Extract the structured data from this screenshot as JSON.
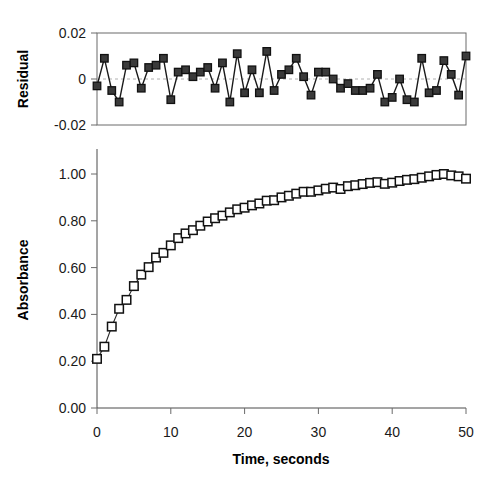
{
  "chart_data": [
    {
      "type": "scatter",
      "name": "residual-plot",
      "title": "",
      "xlabel": "",
      "ylabel": "Residual",
      "xlim": [
        0,
        50
      ],
      "ylim": [
        -0.02,
        0.02
      ],
      "grid": false,
      "legend": "none",
      "marker": "filled-square",
      "yticklabels": [
        "0.02",
        "0",
        "-0.02"
      ],
      "ytickvalues": [
        0.02,
        0,
        -0.02
      ],
      "xticklabels": [],
      "x": [
        0,
        1,
        2,
        3,
        4,
        5,
        6,
        7,
        8,
        9,
        10,
        11,
        12,
        13,
        14,
        15,
        16,
        17,
        18,
        19,
        20,
        21,
        22,
        23,
        24,
        25,
        26,
        27,
        28,
        29,
        30,
        31,
        32,
        33,
        34,
        35,
        36,
        37,
        38,
        39,
        40,
        41,
        42,
        43,
        44,
        45,
        46,
        47,
        48,
        49,
        50
      ],
      "values": [
        -0.003,
        0.009,
        -0.005,
        -0.01,
        0.006,
        0.007,
        -0.004,
        0.005,
        0.006,
        0.009,
        -0.009,
        0.003,
        0.004,
        0.001,
        0.003,
        0.005,
        -0.004,
        0.007,
        -0.01,
        0.011,
        -0.006,
        0.004,
        -0.006,
        0.012,
        -0.005,
        0.002,
        0.004,
        0.009,
        0.001,
        -0.007,
        0.003,
        0.003,
        0.0,
        -0.004,
        -0.002,
        -0.005,
        -0.005,
        -0.004,
        0.002,
        -0.01,
        -0.008,
        0.0,
        -0.009,
        -0.01,
        0.009,
        -0.006,
        -0.005,
        0.008,
        0.002,
        -0.007,
        0.01
      ]
    },
    {
      "type": "scatter",
      "name": "absorbance-kinetics",
      "title": "",
      "xlabel": "Time, seconds",
      "ylabel": "Absorbance",
      "xlim": [
        0,
        50
      ],
      "ylim": [
        0.0,
        1.1
      ],
      "grid": false,
      "legend": "none",
      "marker": "open-square",
      "xticklabels": [
        "0",
        "10",
        "20",
        "30",
        "40",
        "50"
      ],
      "xtickvalues": [
        0,
        10,
        20,
        30,
        40,
        50
      ],
      "yticklabels": [
        "0.00",
        "0.20",
        "0.40",
        "0.60",
        "0.80",
        "1.00"
      ],
      "ytickvalues": [
        0.0,
        0.2,
        0.4,
        0.6,
        0.8,
        1.0
      ],
      "x": [
        0,
        1,
        2,
        3,
        4,
        5,
        6,
        7,
        8,
        9,
        10,
        11,
        12,
        13,
        14,
        15,
        16,
        17,
        18,
        19,
        20,
        21,
        22,
        23,
        24,
        25,
        26,
        27,
        28,
        29,
        30,
        31,
        32,
        33,
        34,
        35,
        36,
        37,
        38,
        39,
        40,
        41,
        42,
        43,
        44,
        45,
        46,
        47,
        48,
        49,
        50
      ],
      "values": [
        0.21,
        0.262,
        0.348,
        0.424,
        0.462,
        0.521,
        0.57,
        0.602,
        0.643,
        0.663,
        0.695,
        0.726,
        0.746,
        0.76,
        0.779,
        0.797,
        0.811,
        0.822,
        0.836,
        0.849,
        0.856,
        0.866,
        0.874,
        0.886,
        0.888,
        0.9,
        0.907,
        0.916,
        0.924,
        0.924,
        0.93,
        0.937,
        0.942,
        0.936,
        0.948,
        0.952,
        0.957,
        0.962,
        0.965,
        0.958,
        0.963,
        0.97,
        0.975,
        0.978,
        0.984,
        0.99,
        0.996,
        1.0,
        0.994,
        0.99,
        0.98
      ]
    }
  ],
  "labels": {
    "residual_axis_title": "Residual",
    "absorbance_axis_title": "Absorbance",
    "time_axis_title": "Time, seconds"
  }
}
